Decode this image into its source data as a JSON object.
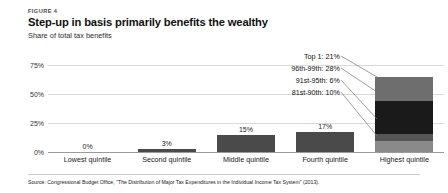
{
  "figure": {
    "label": "FIGURE 4",
    "title": "Step-up in basis primarily benefits the wealthy",
    "subtitle": "Share of total tax benefits",
    "source": "Source: Congressional Budget Office, \"The Distribution of Major Tax Expenditures in the Individual Income Tax System\" (2013)."
  },
  "colors": {
    "bar_dark": "#4a4a4a",
    "segment_top_gray": "#6e6e6e",
    "segment_black": "#1a1a1a",
    "segment_mid_gray": "#555555",
    "segment_light_gray": "#8a8a8a",
    "gridline": "#d8d8d8",
    "axis": "#9a9a9a",
    "text": "#111111"
  },
  "chart_data": {
    "type": "bar",
    "title": "Step-up in basis primarily benefits the wealthy",
    "subtitle": "Share of total tax benefits",
    "xlabel": "",
    "ylabel": "Share of total tax benefits",
    "ylim": [
      0,
      80
    ],
    "grid": true,
    "legend_position": "none",
    "stacked_last_bar": true,
    "categories": [
      "Lowest quintile",
      "Second quintile",
      "Middle quintile",
      "Fourth quintile",
      "Highest quintile"
    ],
    "values": [
      0,
      3,
      15,
      17,
      65
    ],
    "value_labels": [
      "0%",
      "3%",
      "15%",
      "17%",
      ""
    ],
    "yticks": [
      0,
      25,
      50,
      75
    ],
    "ytick_labels": [
      "0%",
      "25%",
      "50%",
      "75%"
    ],
    "highest_quintile_breakdown": [
      {
        "name": "81st-90th",
        "value": 10,
        "label": "81st-90th: 10%",
        "color": "#8a8a8a"
      },
      {
        "name": "91st-95th",
        "value": 6,
        "label": "91st-95th: 6%",
        "color": "#555555"
      },
      {
        "name": "96th-99th",
        "value": 28,
        "label": "96th-99th: 28%",
        "color": "#1a1a1a"
      },
      {
        "name": "Top 1",
        "value": 21,
        "label": "Top 1: 21%",
        "color": "#6e6e6e"
      }
    ]
  }
}
